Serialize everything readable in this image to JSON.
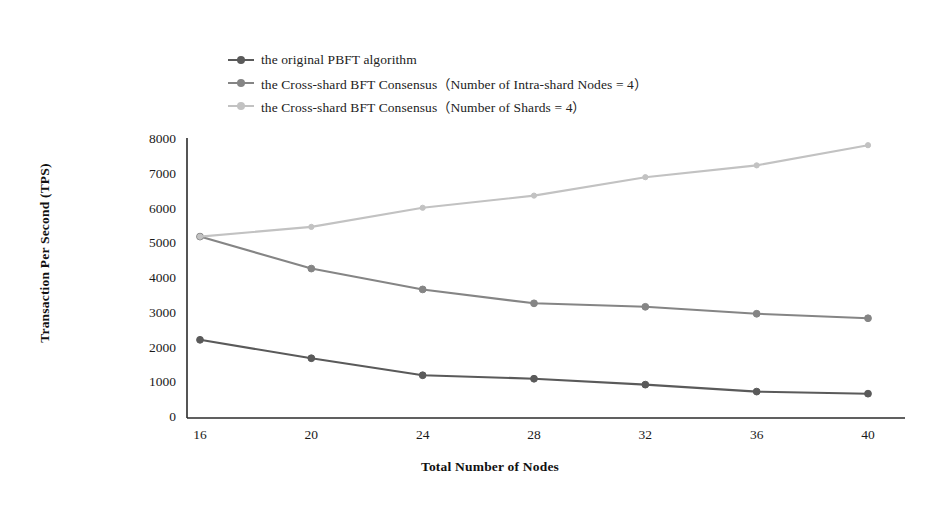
{
  "chart_data": {
    "type": "line",
    "title": "",
    "xlabel": "Total Number of Nodes",
    "ylabel": "Transaction Per Second (TPS)",
    "categories": [
      16,
      20,
      24,
      28,
      32,
      36,
      40
    ],
    "x": [
      16,
      20,
      24,
      28,
      32,
      36,
      40
    ],
    "xlim": [
      14,
      42
    ],
    "ylim": [
      0,
      8000
    ],
    "yticks": [
      0,
      1000,
      2000,
      3000,
      4000,
      5000,
      6000,
      7000,
      8000
    ],
    "xticks": [
      16,
      20,
      24,
      28,
      32,
      36,
      40
    ],
    "ytick_labels": [
      "0",
      "1000",
      "2000",
      "3000",
      "4000",
      "5000",
      "6000",
      "7000",
      "8000"
    ],
    "xtick_labels": [
      "16",
      "20",
      "24",
      "28",
      "32",
      "36",
      "40"
    ],
    "grid": false,
    "legend_position": "top-left",
    "series": [
      {
        "name": "the original PBFT algorithm",
        "color": "#5a5a5a",
        "marker": "circle",
        "values": [
          2250,
          1720,
          1230,
          1130,
          960,
          760,
          700
        ]
      },
      {
        "name": "the Cross-shard BFT Consensus（Number of Intra-shard Nodes = 4）",
        "color": "#858585",
        "marker": "circle",
        "values": [
          5220,
          4300,
          3700,
          3300,
          3200,
          3000,
          2870
        ]
      },
      {
        "name": "the Cross-shard BFT Consensus（Number of Shards = 4）",
        "color": "#c2c2c2",
        "marker": "circle",
        "values": [
          5220,
          5500,
          6050,
          6400,
          6930,
          7270,
          7850
        ]
      }
    ]
  },
  "axis": {
    "x_title": "Total Number of Nodes",
    "y_title": "Transaction Per Second (TPS)"
  },
  "legend": {
    "items": [
      {
        "label": "the original PBFT algorithm"
      },
      {
        "label": "the Cross-shard BFT Consensus（Number of Intra-shard Nodes = 4）"
      },
      {
        "label": "the Cross-shard BFT Consensus（Number of Shards = 4）"
      }
    ]
  },
  "colors": {
    "series1": "#5a5a5a",
    "series2": "#858585",
    "series3": "#c2c2c2",
    "axis": "#2b2b2b",
    "background": "#ffffff"
  }
}
